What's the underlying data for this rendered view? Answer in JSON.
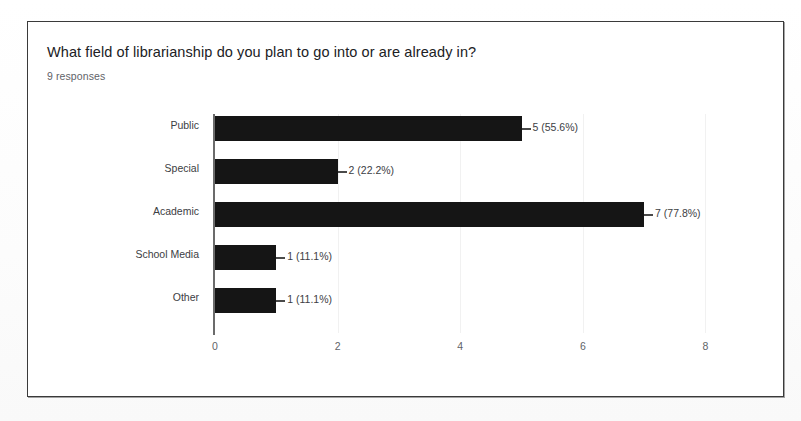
{
  "chart_data": {
    "type": "bar",
    "orientation": "horizontal",
    "title": "What field of librarianship do you plan to go into or are already in?",
    "subtitle": "9 responses",
    "categories": [
      "Public",
      "Special",
      "Academic",
      "School Media",
      "Other"
    ],
    "values": [
      5,
      2,
      7,
      1,
      1
    ],
    "data_labels": [
      "5 (55.6%)",
      "2 (22.2%)",
      "7 (77.8%)",
      "1 (11.1%)",
      "1 (11.1%)"
    ],
    "percentages": [
      55.6,
      22.2,
      77.8,
      11.1,
      11.1
    ],
    "xlabel": "",
    "ylabel": "",
    "xlim": [
      0,
      8
    ],
    "xticks": [
      "0",
      "2",
      "4",
      "6",
      "8"
    ],
    "xtick_values": [
      0,
      2,
      4,
      6,
      8
    ],
    "grid": false,
    "legend": false,
    "bar_color": "#151515",
    "total_responses": 9
  }
}
